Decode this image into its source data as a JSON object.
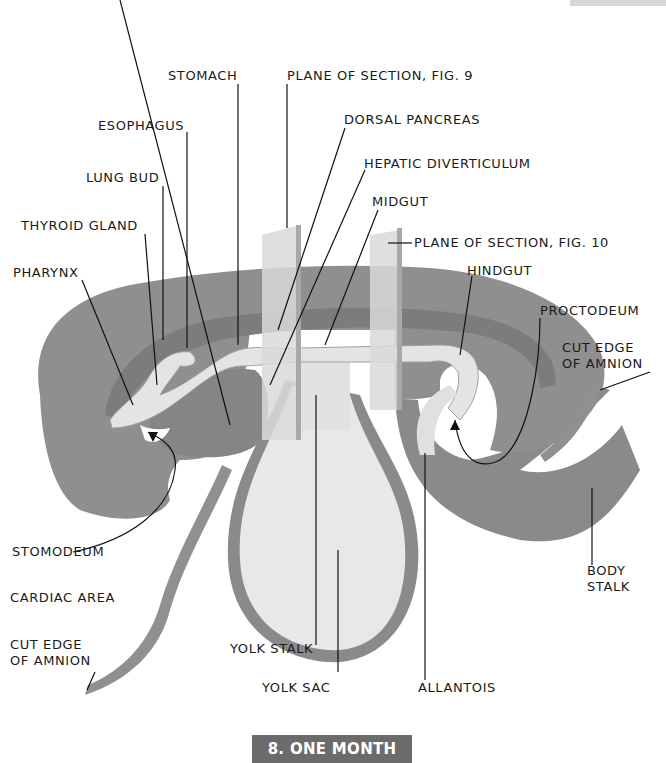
{
  "figure": {
    "caption": "8. ONE MONTH",
    "colors": {
      "tissue": "#8f8f8f",
      "tissue_dark": "#7a7a7a",
      "gut": "#e4e4e4",
      "yolk_sac": "#e9e9e9",
      "plane": "#d6d6d6",
      "caption_bg": "#6b6b6b",
      "leader": "#111111"
    }
  },
  "labels": {
    "stomach": "STOMACH",
    "plane_fig9": "PLANE OF SECTION, FIG. 9",
    "esophagus": "ESOPHAGUS",
    "dorsal_pancreas": "DORSAL PANCREAS",
    "hepatic_diverticulum": "HEPATIC DIVERTICULUM",
    "lung_bud": "LUNG BUD",
    "midgut": "MIDGUT",
    "thyroid_gland": "THYROID GLAND",
    "plane_fig10": "PLANE OF SECTION, FIG. 10",
    "pharynx": "PHARYNX",
    "hindgut": "HINDGUT",
    "proctodeum": "PROCTODEUM",
    "cut_edge_amnion_right": "CUT EDGE\nOF AMNION",
    "stomodeum": "STOMODEUM",
    "cardiac_area": "CARDIAC AREA",
    "body_stalk": "BODY\nSTALK",
    "cut_edge_amnion_left": "CUT EDGE\nOF AMNION",
    "yolk_stalk": "YOLK STALK",
    "yolk_sac": "YOLK SAC",
    "allantois": "ALLANTOIS"
  }
}
